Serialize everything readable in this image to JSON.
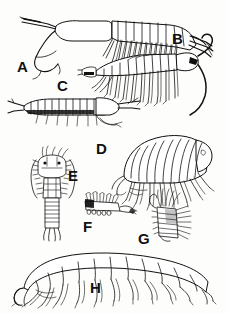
{
  "plate": {
    "title": "Crustacean specimens plate",
    "background_color": "#fdfdfb",
    "ink_color": "#111111",
    "style": "black and white scientific line drawing",
    "figure_count": 8
  },
  "figures": [
    {
      "id": "A",
      "label": "A",
      "caption": "A",
      "description": "Elongate mysid-like crustacean, lateral view, head to left with long antennae, many paired thoracic legs, fan-shaped tail at right",
      "orientation": "lateral, head left",
      "label_x": 17,
      "label_y": 59
    },
    {
      "id": "B",
      "label": "B",
      "caption": "B",
      "description": "Elongate crustacean, lateral view, head to right with long curving antenna, segmented body and many paired legs",
      "orientation": "lateral, head right",
      "label_x": 172,
      "label_y": 31
    },
    {
      "id": "C",
      "label": "C",
      "caption": "C",
      "description": "Slender segmented crustacean with boxy body segments, lateral view, head to right, fine setae beneath",
      "orientation": "lateral, head right",
      "label_x": 57,
      "label_y": 78
    },
    {
      "id": "D",
      "label": "D",
      "caption": "D",
      "description": "Arched amphipod with strongly segmented body, lateral view, head to right, robust pereopods below",
      "orientation": "lateral, head right",
      "label_x": 96,
      "label_y": 141
    },
    {
      "id": "E",
      "label": "E",
      "caption": "E",
      "description": "Dorsal view of isopod-like crustacean with broad head, paired antennae and narrow segmented abdomen",
      "orientation": "dorsal",
      "label_x": 68,
      "label_y": 168
    },
    {
      "id": "F",
      "label": "F",
      "caption": "F",
      "description": "Small appendage or maxilliped with dense rows of setae",
      "orientation": "detail",
      "label_x": 83,
      "label_y": 219
    },
    {
      "id": "G",
      "label": "G",
      "caption": "G",
      "description": "Small setose appendage detail with bristle tufts",
      "orientation": "detail",
      "label_x": 138,
      "label_y": 231
    },
    {
      "id": "H",
      "label": "H",
      "caption": "H",
      "description": "Large arched segmented crustacean, lateral view, head to left, rectangular body segments and slender legs",
      "orientation": "lateral, head left",
      "label_x": 90,
      "label_y": 280
    }
  ]
}
